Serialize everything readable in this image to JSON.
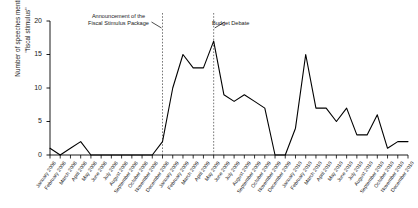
{
  "chart_data": {
    "type": "line",
    "title": "",
    "xlabel": "",
    "ylabel": "Number of speeches mentioning \"fiscal stimulus\"",
    "ylabel_line1": "Number of speeches mentioning",
    "ylabel_line2": "\"fiscal stimulus\"",
    "ylim": [
      0,
      20
    ],
    "yticks": [
      0,
      5,
      10,
      15,
      20
    ],
    "grid": false,
    "legend": "none",
    "line_color": "#000000",
    "categories": [
      "January 2008",
      "February 2008",
      "March 2008",
      "April 2008",
      "May 2008",
      "June 2008",
      "July 2008",
      "August 2008",
      "September 2008",
      "October 2008",
      "November 2008",
      "December 2008",
      "January 2009",
      "February 2009",
      "March 2009",
      "April 2009",
      "May 2009",
      "June 2009",
      "July 2009",
      "August 2009",
      "September 2009",
      "October 2009",
      "November 2009",
      "December 2009",
      "January 2010",
      "February 2010",
      "March 2010",
      "April 2010",
      "May 2010",
      "June 2010",
      "July 2010",
      "August 2010",
      "September 2010",
      "October 2010",
      "November 2010",
      "December 2010"
    ],
    "values": [
      1,
      0,
      1,
      2,
      0,
      0,
      0,
      0,
      0,
      0,
      0,
      2,
      10,
      15,
      13,
      13,
      17,
      9,
      8,
      9,
      8,
      7,
      0,
      0,
      4,
      15,
      7,
      7,
      5,
      7,
      3,
      3,
      6,
      1,
      2,
      2
    ],
    "annotations": [
      {
        "name": "fiscal-stimulus-announcement",
        "line1": "Announcement of the",
        "line2": "Fiscal Stimulus Package",
        "at_category": "December 2008"
      },
      {
        "name": "budget-debate",
        "line1": "Budget Debate",
        "at_category": "May 2009"
      }
    ]
  }
}
